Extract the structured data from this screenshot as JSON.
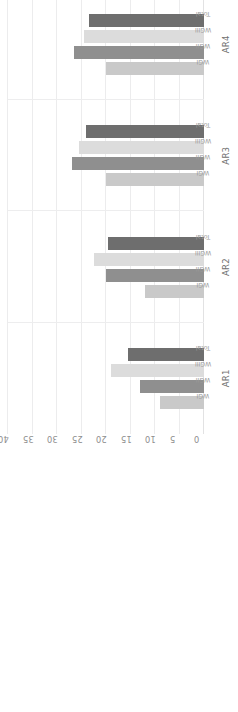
{
  "chart_data": {
    "type": "bar",
    "title": "",
    "xlabel": "",
    "ylabel": "Percentage of IPCC Authors from the Global South (%)",
    "ylim": [
      0,
      40
    ],
    "yticks": [
      "0",
      "5",
      "10",
      "15",
      "20",
      "25",
      "30",
      "35",
      "40"
    ],
    "grid": true,
    "legend": "none",
    "orientation": "rotated-90",
    "categories": [
      "AR1",
      "AR2",
      "AR3",
      "AR4",
      "AR5",
      "AR6"
    ],
    "series_names": [
      "WGI",
      "WGII",
      "WGIII",
      "Total"
    ],
    "colors": {
      "wg1": "#c9c9c9",
      "wg2": "#8f8f8f",
      "wg3": "#dcdcdc",
      "total": "#6e6e6e",
      "grid": "#ececed",
      "text": "#8b8b8b"
    },
    "series": [
      {
        "name": "WGI",
        "values": [
          9.0,
          12.0,
          20.0,
          20.0,
          23.5,
          30.0
        ]
      },
      {
        "name": "WGII",
        "values": [
          13.0,
          20.0,
          27.0,
          26.5,
          31.5,
          36.5
        ]
      },
      {
        "name": "WGIII",
        "values": [
          19.0,
          22.5,
          25.5,
          24.5,
          35.5,
          36.0
        ]
      },
      {
        "name": "Total",
        "values": [
          15.5,
          19.5,
          24.0,
          23.5,
          30.0,
          34.5
        ]
      }
    ],
    "groups": [
      {
        "label": "AR1",
        "bars": [
          {
            "label": "WGI",
            "value": 9.0
          },
          {
            "label": "WGII",
            "value": 13.0
          },
          {
            "label": "WGIII",
            "value": 19.0
          },
          {
            "label": "Total",
            "value": 15.5
          }
        ]
      },
      {
        "label": "AR2",
        "bars": [
          {
            "label": "WGI",
            "value": 12.0
          },
          {
            "label": "WGII",
            "value": 20.0
          },
          {
            "label": "WGIII",
            "value": 22.5
          },
          {
            "label": "Total",
            "value": 19.5
          }
        ]
      },
      {
        "label": "AR3",
        "bars": [
          {
            "label": "WGI",
            "value": 20.0
          },
          {
            "label": "WGII",
            "value": 27.0
          },
          {
            "label": "WGIII",
            "value": 25.5
          },
          {
            "label": "Total",
            "value": 24.0
          }
        ]
      },
      {
        "label": "AR4",
        "bars": [
          {
            "label": "WGI",
            "value": 20.0
          },
          {
            "label": "WGII",
            "value": 26.5
          },
          {
            "label": "WGIII",
            "value": 24.5
          },
          {
            "label": "Total",
            "value": 23.5
          }
        ]
      },
      {
        "label": "AR5",
        "bars": [
          {
            "label": "WGI",
            "value": 23.5
          },
          {
            "label": "WGII",
            "value": 31.5
          },
          {
            "label": "WGIII",
            "value": 35.5
          },
          {
            "label": "Total",
            "value": 30.0
          }
        ]
      },
      {
        "label": "AR6",
        "bars": [
          {
            "label": "WGI",
            "value": 30.0
          },
          {
            "label": "WGII",
            "value": 36.5
          },
          {
            "label": "WGIII",
            "value": 36.0
          },
          {
            "label": "Total",
            "value": 34.5
          }
        ]
      }
    ]
  }
}
